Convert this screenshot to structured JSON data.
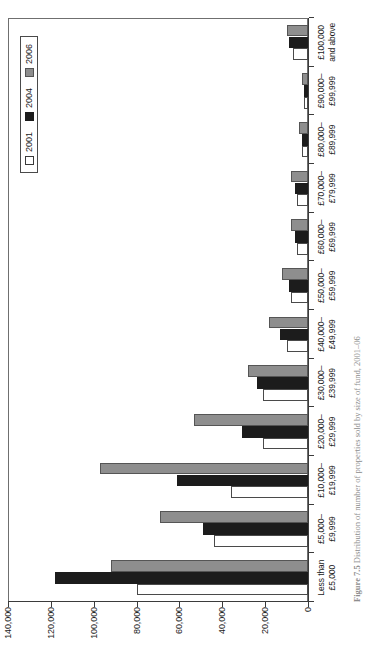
{
  "chart_data": {
    "type": "bar",
    "orientation": "vertical",
    "title": "",
    "xlabel": "",
    "ylabel": "",
    "ylim": [
      0,
      140000
    ],
    "yticks": [
      "0",
      "20,000",
      "40,000",
      "60,000",
      "80,000",
      "100,000",
      "120,000",
      "140,000"
    ],
    "ytick_values": [
      0,
      20000,
      40000,
      60000,
      80000,
      100000,
      120000,
      140000
    ],
    "grid": false,
    "legend_position": "top-right",
    "categories": [
      "Less than\n£5,000",
      "£5,000–\n£9,999",
      "£10,000–\n£19,999",
      "£20,000–\n£29,999",
      "£30,000–\n£39,999",
      "£40,000–\n£49,999",
      "£50,000–\n£59,999",
      "£60,000–\n£69,999",
      "£70,000–\n£79,999",
      "£80,000–\n£89,999",
      "£90,000–\n£99,999",
      "£100,000\nand above"
    ],
    "category_lines": [
      [
        "Less than",
        "£5,000"
      ],
      [
        "£5,000–",
        "£9,999"
      ],
      [
        "£10,000–",
        "£19,999"
      ],
      [
        "£20,000–",
        "£29,999"
      ],
      [
        "£30,000–",
        "£39,999"
      ],
      [
        "£40,000–",
        "£49,999"
      ],
      [
        "£50,000–",
        "£59,999"
      ],
      [
        "£60,000–",
        "£69,999"
      ],
      [
        "£70,000–",
        "£79,999"
      ],
      [
        "£80,000–",
        "£89,999"
      ],
      [
        "£90,000–",
        "£99,999"
      ],
      [
        "£100,000",
        "and above"
      ]
    ],
    "series": [
      {
        "name": "2001",
        "color": "#ffffff",
        "values": [
          80000,
          44000,
          36000,
          21000,
          21000,
          10000,
          8000,
          5000,
          5000,
          3000,
          2000,
          7000
        ]
      },
      {
        "name": "2004",
        "color": "#1c1c1c",
        "values": [
          118000,
          49000,
          61000,
          31000,
          24000,
          13000,
          9000,
          6000,
          6000,
          3000,
          2000,
          9000
        ]
      },
      {
        "name": "2006",
        "color": "#8e8e8e",
        "values": [
          92000,
          69000,
          97000,
          53000,
          28000,
          18000,
          12000,
          8000,
          8000,
          4000,
          3000,
          10000
        ]
      }
    ]
  },
  "legend": {
    "items": [
      {
        "label": "2001",
        "swatch": "s2001"
      },
      {
        "label": "2004",
        "swatch": "s2004"
      },
      {
        "label": "2006",
        "swatch": "s2006"
      }
    ]
  },
  "caption": {
    "number": "Figure 7.5",
    "text": "Distribution of number of properties sold by size of fund, 2001–06"
  }
}
